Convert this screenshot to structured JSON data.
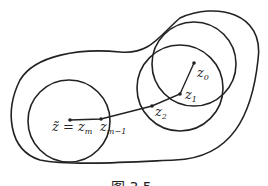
{
  "figure": {
    "caption": "图 3.5",
    "labels": {
      "z0": {
        "base": "z",
        "sub": "0"
      },
      "z1": {
        "base": "z",
        "sub": "1"
      },
      "z2": {
        "base": "z",
        "sub": "2"
      },
      "zm1": {
        "base": "z",
        "sub": "m−1"
      },
      "zm": {
        "prefix": "z̃ = z",
        "sub": "m"
      }
    }
  }
}
